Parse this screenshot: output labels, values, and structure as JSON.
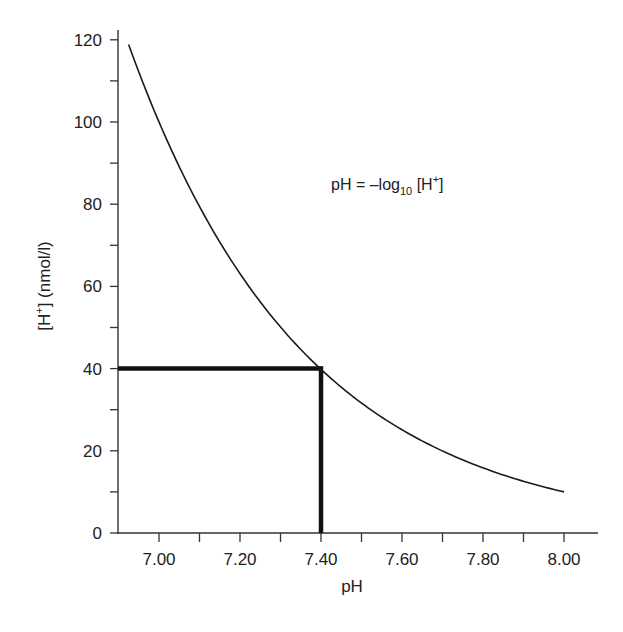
{
  "chart_data": {
    "type": "line",
    "title": "",
    "xlabel": "pH",
    "ylabel_main": "[H",
    "ylabel_sup": "+",
    "ylabel_rest": "] (nmol/l)",
    "xlim": [
      6.9,
      8.08
    ],
    "ylim": [
      0,
      122
    ],
    "x_ticks": [
      {
        "value": 7.0,
        "label": "7.00"
      },
      {
        "value": 7.2,
        "label": "7.20"
      },
      {
        "value": 7.4,
        "label": "7.40"
      },
      {
        "value": 7.6,
        "label": "7.60"
      },
      {
        "value": 7.8,
        "label": "7.80"
      },
      {
        "value": 8.0,
        "label": "8.00"
      }
    ],
    "x_minor_ticks": [
      7.1,
      7.3,
      7.5,
      7.7,
      7.9
    ],
    "y_ticks": [
      {
        "value": 0,
        "label": "0"
      },
      {
        "value": 20,
        "label": "20"
      },
      {
        "value": 40,
        "label": "40"
      },
      {
        "value": 60,
        "label": "60"
      },
      {
        "value": 80,
        "label": "80"
      },
      {
        "value": 100,
        "label": "100"
      },
      {
        "value": 120,
        "label": "120"
      }
    ],
    "y_minor_ticks": [
      10,
      30,
      50,
      70,
      90,
      110
    ],
    "series": [
      {
        "name": "[H+] vs pH",
        "formula": "H = 10^(9 - pH)",
        "x_range": [
          6.925,
          8.0
        ],
        "points": [
          {
            "x": 6.925,
            "y": 118.9
          },
          {
            "x": 7.0,
            "y": 100.0
          },
          {
            "x": 7.1,
            "y": 79.4
          },
          {
            "x": 7.2,
            "y": 63.1
          },
          {
            "x": 7.3,
            "y": 50.1
          },
          {
            "x": 7.4,
            "y": 39.8
          },
          {
            "x": 7.5,
            "y": 31.6
          },
          {
            "x": 7.6,
            "y": 25.1
          },
          {
            "x": 7.7,
            "y": 20.0
          },
          {
            "x": 7.8,
            "y": 15.8
          },
          {
            "x": 7.9,
            "y": 12.6
          },
          {
            "x": 8.0,
            "y": 10.0
          }
        ]
      }
    ],
    "highlight": {
      "x": 7.4,
      "y": 40
    },
    "annotation": {
      "prefix": "pH = –log",
      "subscript": "10",
      "middle": " [H",
      "superscript": "+",
      "suffix": "]"
    },
    "grid": false,
    "legend": "none"
  }
}
